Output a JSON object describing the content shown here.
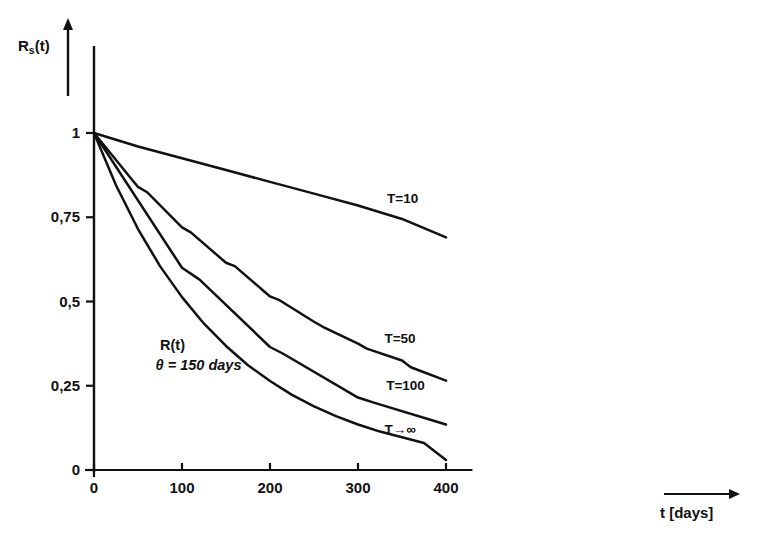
{
  "chart_data": {
    "type": "line",
    "title": "",
    "subtitle": "",
    "xlabel": "t [days]",
    "ylabel": "R_s(t)",
    "xlim": [
      0,
      420
    ],
    "ylim": [
      0,
      1.08
    ],
    "xticks": [
      0,
      100,
      200,
      300,
      400
    ],
    "xticklabels": [
      "0",
      "100",
      "200",
      "300",
      "400"
    ],
    "yticks": [
      0,
      0.25,
      0.5,
      0.75,
      1
    ],
    "yticklabels": [
      "0",
      "0,25",
      "0,5",
      "0,75",
      "1"
    ],
    "grid": false,
    "legend_position": "inline-right-of-curves",
    "annotations": [
      {
        "text": "R(t)",
        "x": 75,
        "y": 0.365
      },
      {
        "text": "θ = 150 days",
        "x": 70,
        "y": 0.305
      }
    ],
    "series": [
      {
        "name": "T=10",
        "label": "T=10",
        "label_x": 333,
        "label_y": 0.8,
        "x": [
          0,
          50,
          100,
          150,
          200,
          250,
          300,
          350,
          400
        ],
        "y": [
          1.0,
          0.96,
          0.925,
          0.89,
          0.855,
          0.82,
          0.785,
          0.745,
          0.69
        ]
      },
      {
        "name": "T=50",
        "label": "T=50",
        "label_x": 330,
        "label_y": 0.385,
        "x": [
          0,
          50,
          60,
          100,
          110,
          150,
          160,
          200,
          210,
          250,
          260,
          300,
          310,
          350,
          360,
          400
        ],
        "y": [
          1.0,
          0.84,
          0.825,
          0.72,
          0.705,
          0.615,
          0.605,
          0.515,
          0.505,
          0.44,
          0.425,
          0.375,
          0.36,
          0.325,
          0.305,
          0.265
        ]
      },
      {
        "name": "T=100",
        "label": "T=100",
        "label_x": 332,
        "label_y": 0.245,
        "x": [
          0,
          100,
          120,
          200,
          215,
          300,
          318,
          400
        ],
        "y": [
          1.0,
          0.6,
          0.565,
          0.365,
          0.345,
          0.215,
          0.2,
          0.135
        ]
      },
      {
        "name": "T→∞",
        "label": "T→∞",
        "label_x": 330,
        "label_y": 0.115,
        "x": [
          0,
          25,
          50,
          75,
          100,
          125,
          150,
          175,
          200,
          225,
          250,
          275,
          300,
          325,
          350,
          375,
          400
        ],
        "y": [
          1.0,
          0.845,
          0.715,
          0.605,
          0.513,
          0.434,
          0.368,
          0.311,
          0.264,
          0.223,
          0.189,
          0.16,
          0.135,
          0.114,
          0.097,
          0.08,
          0.03
        ]
      }
    ],
    "axis_arrow_y": true,
    "axis_arrow_x_label_arrow": true,
    "line_color": "#111111",
    "background_color": "#ffffff"
  },
  "axes": {
    "y_axis_label": "R",
    "y_axis_label_sub": "s",
    "y_axis_label_tail": "(t)",
    "x_axis_label": "t [days]"
  }
}
